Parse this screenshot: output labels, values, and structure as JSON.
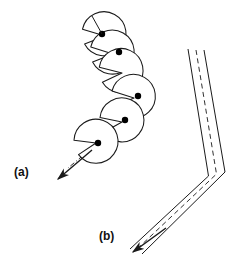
{
  "figure": {
    "background_color": "#ffffff",
    "stroke_color": "#1a1a1a",
    "dot_color": "#000000",
    "labels": [
      {
        "id": "panel-label-a",
        "text": "(a)",
        "x": 14,
        "y": 176
      },
      {
        "id": "panel-label-b",
        "text": "(b)",
        "x": 99,
        "y": 240
      }
    ],
    "panel_a": {
      "description": "chain of notched circular sectors along a dash-dot axis with centre dots and a directional arrow",
      "sector_radius": 22,
      "notch_half_angle_deg": 33,
      "sectors": [
        {
          "cx": 105,
          "cy": 36,
          "notch_dir_deg": 200
        },
        {
          "cx": 113,
          "cy": 54,
          "notch_dir_deg": 205
        },
        {
          "cx": 122,
          "cy": 73,
          "notch_dir_deg": 210
        },
        {
          "cx": 132,
          "cy": 97,
          "notch_dir_deg": 218
        },
        {
          "cx": 120,
          "cy": 122,
          "notch_dir_deg": 228
        },
        {
          "cx": 95,
          "cy": 143,
          "notch_dir_deg": 236
        }
      ],
      "centre_dots": [
        {
          "cx": 102,
          "cy": 34
        },
        {
          "cx": 119,
          "cy": 52
        },
        {
          "cx": 138,
          "cy": 96
        },
        {
          "cx": 125,
          "cy": 120
        },
        {
          "cx": 98,
          "cy": 143
        }
      ],
      "dot_radius": 3.2,
      "axis_polyline": "92,16 102,34 119,52 138,96 125,120 98,143 66,170",
      "axis_style": "dash-dot",
      "arrow": {
        "from_x": 92,
        "from_y": 150,
        "tip_x": 56,
        "tip_y": 180
      }
    },
    "panel_b": {
      "description": "bent ribbon / band with dashed centreline and directional arrow at the lower tip",
      "band_width": 13,
      "centreline_polyline": "196,50 216,174 133,250",
      "left_edge_polyline": "188,49 208,176 130,249",
      "right_edge_polyline": "205,50 226,172 141,253",
      "centreline_style": "dashed",
      "arrow": {
        "from_x": 165,
        "from_y": 227,
        "tip_x": 132,
        "tip_y": 251
      }
    }
  }
}
